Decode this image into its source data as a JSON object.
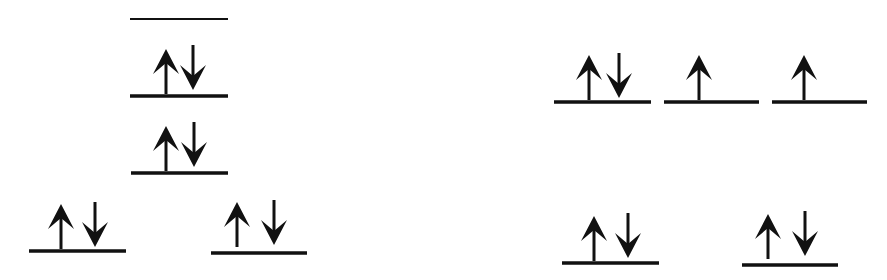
{
  "diagram": {
    "type": "orbital-energy-diagram",
    "stroke_color": "#111111",
    "background": "#ffffff",
    "left_group": {
      "description": "five orbital levels in a pyramid arrangement",
      "levels": [
        {
          "id": "L1",
          "x1": 130,
          "x2": 228,
          "y": 19,
          "electrons": "empty",
          "thin": true
        },
        {
          "id": "L2",
          "x1": 130,
          "x2": 228,
          "y": 96,
          "electrons": "paired"
        },
        {
          "id": "L3",
          "x1": 131,
          "x2": 228,
          "y": 173,
          "electrons": "paired"
        },
        {
          "id": "L4",
          "x1": 29,
          "x2": 126,
          "y": 251,
          "electrons": "paired"
        },
        {
          "id": "L5",
          "x1": 211,
          "x2": 307,
          "y": 253,
          "electrons": "paired"
        }
      ]
    },
    "right_group": {
      "description": "three degenerate upper levels and two lower levels",
      "levels": [
        {
          "id": "R1",
          "x1": 554,
          "x2": 651,
          "y": 102,
          "electrons": "paired"
        },
        {
          "id": "R2",
          "x1": 664,
          "x2": 759,
          "y": 102,
          "electrons": "up"
        },
        {
          "id": "R3",
          "x1": 772,
          "x2": 867,
          "y": 102,
          "electrons": "up"
        },
        {
          "id": "R4",
          "x1": 562,
          "x2": 659,
          "y": 263,
          "electrons": "paired"
        },
        {
          "id": "R5",
          "x1": 742,
          "x2": 838,
          "y": 265,
          "electrons": "paired"
        }
      ]
    }
  }
}
